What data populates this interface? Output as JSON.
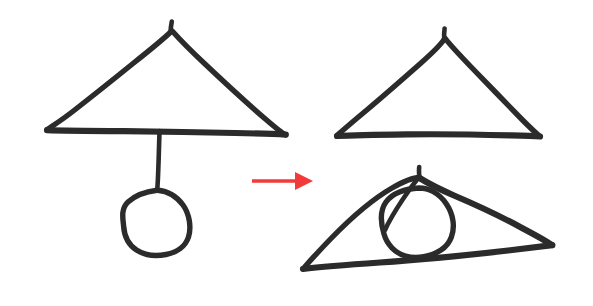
{
  "canvas": {
    "width": 593,
    "height": 306,
    "background_color": "#ffffff",
    "ink_color": "#2b2b2b",
    "arrow_color": "#f23a3a",
    "caption": "Hand-drawn sketch: a triangle with a circle hanging below it on a line transforms, via a red arrow, into a triangle alone and a tilted triangle with the circle inscribed inside it."
  },
  "figures": {
    "left": {
      "name": "triangle-with-pendulum-circle",
      "triangle": {
        "apex": [
          172,
          30
        ],
        "left_base": [
          47,
          129
        ],
        "right_base": [
          285,
          134
        ]
      },
      "line": {
        "top": [
          159,
          131
        ],
        "bottom": [
          157,
          190
        ]
      },
      "circle": {
        "center": [
          156,
          222
        ],
        "radius": 33
      }
    },
    "right_top": {
      "name": "triangle-only",
      "triangle": {
        "apex": [
          445,
          38
        ],
        "left_base": [
          337,
          135
        ],
        "right_base": [
          540,
          136
        ]
      }
    },
    "right_bottom": {
      "name": "tilted-triangle-with-inscribed-circle",
      "triangle": {
        "apex": [
          420,
          178
        ],
        "left_base": [
          303,
          268
        ],
        "right_base": [
          552,
          245
        ]
      },
      "circle": {
        "center": [
          418,
          222
        ],
        "radius": 35
      }
    }
  },
  "arrow": {
    "name": "transformation-arrow",
    "direction": "right",
    "color": "#f23a3a",
    "start": [
      252,
      181
    ],
    "end": [
      313,
      181
    ],
    "head_width": 18,
    "head_height": 18
  },
  "paths": {
    "left_tri_left_edge": "M47.5,129.5 C49,128 60,121.5 74,110.5 C90,98 112,80.5 133,63.5 C150,50 164,38.5 171.2,31.5",
    "left_tri_right_edge": "M172.2,31.0 C178,37.5 190,50 205,64 C224,82 248,104 266,119.5 C277,129 283,133.5 285.5,134.8",
    "left_tri_base": "M47.0,130.2 C62,130.8 92,131.0 124,131.2 C158,131.6 200,132.2 235,133.0 C262,133.6 278,134.2 285.8,134.6",
    "left_tri_apex_tick": "M170.5,31.5 C170.8,28 171.2,24.5 171.8,21.5",
    "left_line": "M159.5,131.0 C159.2,142 158.8,156 158.3,169 C158.0,178 157.6,185.5 157.2,190.0",
    "left_circle": "M157.0,190.2 C146,191.5 135,195.5 128.0,202.0 C120.5,209 123.0,219.0 123.6,226.0 C124.2,234.5 128.0,244.5 136.5,250.0 C145.0,255.5 156.0,256.5 166.0,254.5 C176.5,252.5 185.5,246.5 188.5,237.0 C191.5,227.5 189.5,214.0 183.0,205.0 C176.5,196.0 167.0,191.0 157.6,190.2 Z",
    "rt_tri_left_edge": "M337.5,135.0 C342,131 353,121.5 368,109 C384,95.5 404,78 421,63 C435,50.5 442,43 444.3,39.0",
    "rt_tri_right_edge": "M445.3,38.5 C450,45 461,56.5 474,70 C489,85.5 508,105 522,119.5 C532,129.5 537,134 539.5,136.0",
    "rt_tri_base": "M337.0,136.0 C349,135.4 376,134.8 407,134.4 C441,134.0 481,134.6 511,135.4 C527,135.8 536,136.2 540.0,136.5",
    "rt_tri_apex_tick": "M444.2,39.0 C444.0,35 444.2,31.5 444.6,28.5",
    "rb_tri_left_edge": "M303.5,268.5 C308,263 318,252 331,238.5 C348,221 372,199.5 392,188.0 C407,179.5 415,177.5 419.0,177.5",
    "rb_tri_top_edge": "M419.5,178.0 C426,182 438,188.5 454,195.5 C474,204 501,216.5 522,228.0 C540,237.5 549,243 552.0,245.0",
    "rb_tri_base": "M303.0,269.0 C318,267.2 347,264.8 380,262.5 C420,259.8 470,254.8 508,250.5 C533,247.6 547,245.8 552.3,245.2",
    "rb_apex_stroke": "M419.0,177.0 C415,182 409,190 403,199 C396,209.5 389,221 385,230",
    "rb_apex_tick": "M419.4,177.5 C419.0,173.5 418.8,170.0 419.2,167.0",
    "rb_circle": "M419.0,188.0 C405,188.5 392,193.5 386.0,202.0 C379.5,211 381.0,224.0 384.0,234.0 C387.0,244.5 395.0,253.0 405.5,256.0 C417.0,259.3 431.0,256.5 441.0,250.0 C451.0,243.5 454.5,232.0 453.0,221.0 C451.5,209.5 444.0,197.5 433.0,191.5 C428.5,189.0 423.5,188.0 419.0,188.0 Z"
  }
}
